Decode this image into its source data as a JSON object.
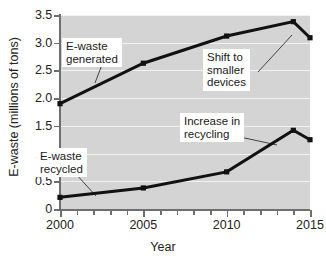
{
  "chart_data": {
    "type": "line",
    "title": "",
    "xlabel": "Year",
    "ylabel": "E-waste (millions of tons)",
    "xlim": [
      2000,
      2015
    ],
    "ylim": [
      0,
      3.5
    ],
    "grid": true,
    "legend": "none (inline labels)",
    "x": [
      2000,
      2005,
      2010,
      2014,
      2015
    ],
    "series": [
      {
        "name": "E-waste generated",
        "values": [
          1.9,
          2.63,
          3.12,
          3.38,
          3.09
        ]
      },
      {
        "name": "E-waste recycled",
        "values": [
          0.21,
          0.38,
          0.67,
          1.42,
          1.25
        ]
      }
    ],
    "ytick_labels": [
      "0",
      "0.5",
      "1.0",
      "1.5",
      "2.0",
      "2.5",
      "3.0",
      "3.5"
    ],
    "ytick_values": [
      0,
      0.5,
      1.0,
      1.5,
      2.0,
      2.5,
      3.0,
      3.5
    ],
    "xtick_labels": [
      "2000",
      "2005",
      "2010",
      "2015"
    ],
    "xtick_values": [
      2000,
      2005,
      2010,
      2015
    ],
    "xminor_step": 1,
    "annotations": [
      {
        "id": "generated",
        "text": "E-waste\ngenerated"
      },
      {
        "id": "shift",
        "text": "Shift to\nsmaller\ndevices"
      },
      {
        "id": "recycled",
        "text": "E-waste\nrecycled"
      },
      {
        "id": "increase",
        "text": "Increase in\nrecycling"
      }
    ],
    "colors": {
      "plot_background": "#d4d4d4",
      "gridline": "#f2f2f2",
      "axis": "#6e6e6e",
      "series_line": "#111111",
      "annotation_background": "#ffffff",
      "annotation_text": "#1a1a1a",
      "leader_line": "#333333"
    }
  }
}
